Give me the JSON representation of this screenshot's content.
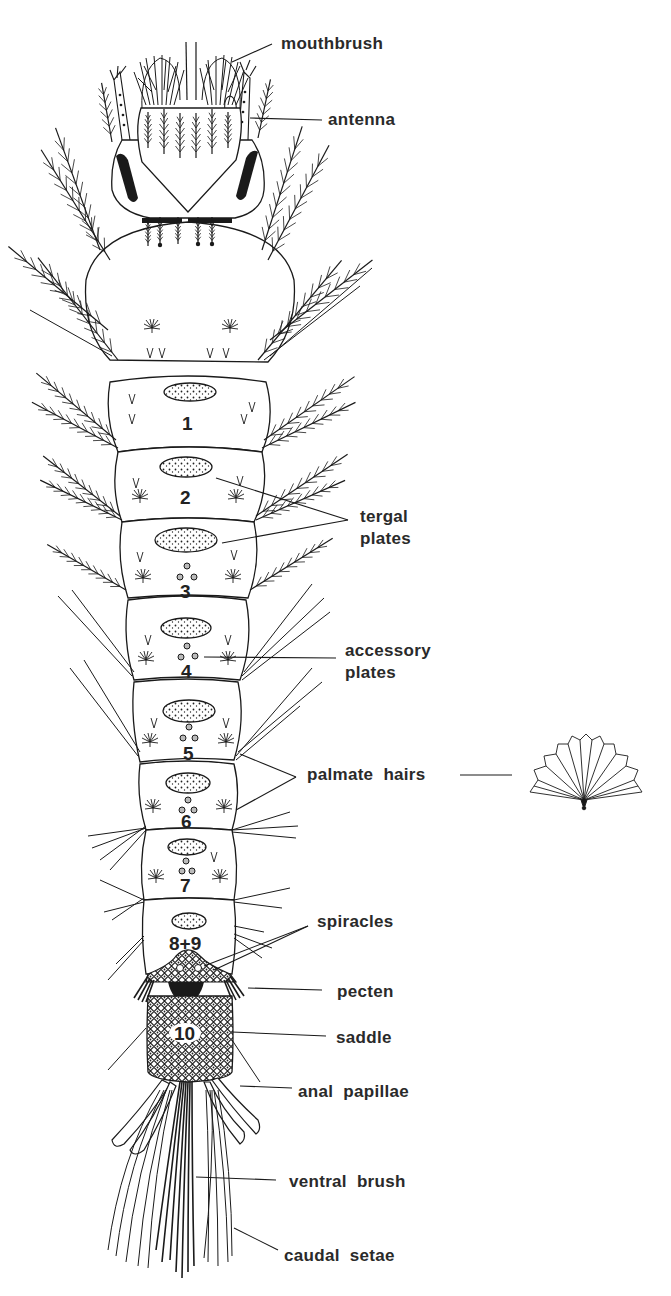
{
  "figure": {
    "labels": {
      "mouthbrush": "mouthbrush",
      "antenna": "antenna",
      "tergal_plates": "tergal\nplates",
      "accessory_plates": "accessory\nplates",
      "palmate_hairs": "palmate  hairs",
      "spiracles": "spiracles",
      "pecten": "pecten",
      "saddle": "saddle",
      "anal_papillae": "anal  papillae",
      "ventral_brush": "ventral  brush",
      "caudal_setae": "caudal  setae"
    },
    "segments": [
      "1",
      "2",
      "3",
      "4",
      "5",
      "6",
      "7",
      "8+9",
      "10"
    ],
    "colors": {
      "ink": "#1a1a1a",
      "label": "#2a2a2a",
      "background": "#ffffff"
    }
  }
}
